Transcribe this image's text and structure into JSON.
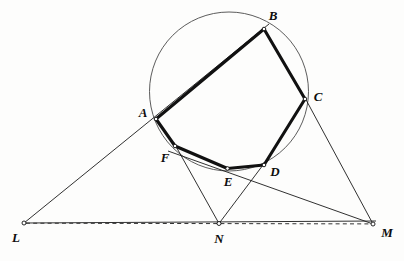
{
  "figure": {
    "width": 404,
    "height": 261,
    "background_color": "#fdfdfc"
  },
  "colors": {
    "chord_stroke": "#111111",
    "thin_stroke": "#1a1a1a",
    "circle_stroke": "#4a4a4a",
    "dashed_stroke": "#333333",
    "label_color": "#0d0d0d",
    "vertex_fill": "#ffffff"
  },
  "circle": {
    "name": "circumcircle",
    "cx": 229,
    "cy": 91.5,
    "r": 79.5
  },
  "points": [
    {
      "id": "A",
      "label": "A",
      "x": 156,
      "y": 119,
      "label_x": 143,
      "label_y": 113
    },
    {
      "id": "B",
      "label": "B",
      "x": 264,
      "y": 29,
      "label_x": 273,
      "label_y": 16
    },
    {
      "id": "C",
      "label": "C",
      "x": 305,
      "y": 99,
      "label_x": 318,
      "label_y": 97
    },
    {
      "id": "D",
      "label": "D",
      "x": 264,
      "y": 165,
      "label_x": 275,
      "label_y": 172
    },
    {
      "id": "E",
      "label": "E",
      "x": 227.5,
      "y": 168.5,
      "label_x": 228,
      "label_y": 182
    },
    {
      "id": "F",
      "label": "F",
      "x": 175,
      "y": 146,
      "label_x": 165,
      "label_y": 158
    },
    {
      "id": "L",
      "label": "L",
      "x": 24,
      "y": 223,
      "label_x": 16,
      "label_y": 238
    },
    {
      "id": "N",
      "label": "N",
      "x": 219,
      "y": 223.5,
      "label_x": 219,
      "label_y": 239
    },
    {
      "id": "M",
      "label": "M",
      "x": 373,
      "y": 224,
      "label_x": 387,
      "label_y": 233
    }
  ],
  "hexagon_sides": [
    {
      "name": "side-AB",
      "from": "A",
      "to": "B"
    },
    {
      "name": "side-BC",
      "from": "B",
      "to": "C"
    },
    {
      "name": "side-CD",
      "from": "C",
      "to": "D"
    },
    {
      "name": "side-DE",
      "from": "D",
      "to": "E"
    },
    {
      "name": "side-EF",
      "from": "E",
      "to": "F"
    },
    {
      "name": "side-FA",
      "from": "F",
      "to": "A"
    }
  ],
  "thin_lines": [
    {
      "name": "line-L-to-A-extended",
      "from": "L",
      "to": "B"
    },
    {
      "name": "line-L-to-E-extended",
      "from": "L",
      "to": "M"
    },
    {
      "name": "line-N-to-F-extended",
      "from": "N",
      "to": "D"
    },
    {
      "name": "line-N-to-D-extended",
      "from": "N",
      "to": "F"
    },
    {
      "name": "line-M-to-C-extended",
      "from": "M",
      "to": "C"
    },
    {
      "name": "line-M-to-D-extended",
      "from": "M",
      "to": "E"
    }
  ],
  "dashed_lines": [
    {
      "name": "collinear-line-LM",
      "from": "L",
      "to": "M"
    }
  ]
}
